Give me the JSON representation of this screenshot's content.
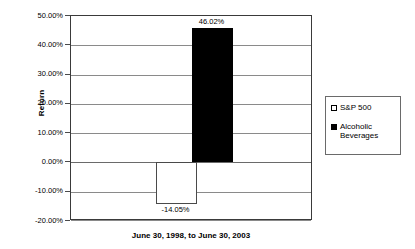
{
  "chart_data": {
    "type": "bar",
    "title": "",
    "xlabel": "June 30, 1998, to June 30, 2003",
    "ylabel": "Return",
    "categories": [
      "June 30, 1998, to June 30, 2003"
    ],
    "ylim": [
      -20.0,
      50.0
    ],
    "ytick_step": 10.0,
    "ytick_labels": [
      "50.00%",
      "40.00%",
      "30.00%",
      "20.00%",
      "10.00%",
      "0.00%",
      "-10.00%",
      "-20.00%"
    ],
    "ytick_values": [
      50.0,
      40.0,
      30.0,
      20.0,
      10.0,
      0.0,
      -10.0,
      -20.0
    ],
    "grid": true,
    "legend_position": "right",
    "series": [
      {
        "name": "S&P 500",
        "legend_label": "S&P 500",
        "values": [
          -14.05
        ],
        "value_labels": [
          "-14.05%"
        ],
        "fill": "#ffffff",
        "stroke": "#4a4a4a",
        "swatch": "outlined"
      },
      {
        "name": "Alcoholic Beverages",
        "legend_label": "Alcoholic\nBeverages",
        "values": [
          46.02
        ],
        "value_labels": [
          "46.02%"
        ],
        "fill": "#000000",
        "stroke": "#000000",
        "swatch": "filled"
      }
    ]
  },
  "axes": {
    "y_title": "Return",
    "x_title": "June 30, 1998, to June 30, 2003"
  },
  "legend": {
    "entries": [
      {
        "label": "S&P 500"
      },
      {
        "label": "Alcoholic\nBeverages"
      }
    ]
  },
  "colors": {
    "sp500_fill": "#ffffff",
    "alcohol_fill": "#000000",
    "gridline": "#8a8a8a",
    "frame": "#3a3a3a",
    "background": "#ffffff"
  }
}
